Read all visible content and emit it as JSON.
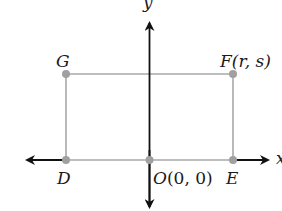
{
  "diagram": {
    "type": "coordinate-plane-rectangle",
    "axes": {
      "x_label": "x",
      "y_label": "y",
      "axis_color": "#111111"
    },
    "rectangle": {
      "line_color": "#a8a8a8",
      "point_color": "#a0a0a0"
    },
    "points": {
      "G": {
        "label": "G"
      },
      "F": {
        "label": "F",
        "coords": "(r, s)"
      },
      "D": {
        "label": "D"
      },
      "O": {
        "label": "O",
        "coords": "(0, 0)"
      },
      "E": {
        "label": "E"
      }
    }
  }
}
